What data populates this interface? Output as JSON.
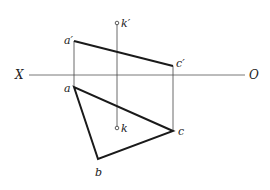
{
  "diagram": {
    "type": "orthographic-projection",
    "axis": {
      "left_label": "X",
      "right_label": "O"
    },
    "front_view": {
      "points": {
        "a_prime": "a′",
        "c_prime": "c′",
        "k_prime": "k′"
      },
      "edges": [
        [
          "a′",
          "c′"
        ]
      ]
    },
    "top_view": {
      "points": {
        "a": "a",
        "b": "b",
        "c": "c",
        "k": "k"
      },
      "edges": [
        [
          "a",
          "b"
        ],
        [
          "b",
          "c"
        ],
        [
          "c",
          "a"
        ]
      ]
    },
    "projection_lines": [
      [
        "a′",
        "a"
      ],
      [
        "c′",
        "c"
      ],
      [
        "k′",
        "k"
      ]
    ],
    "colors": {
      "line": "#1a1a1a",
      "thin": "#444444"
    }
  }
}
